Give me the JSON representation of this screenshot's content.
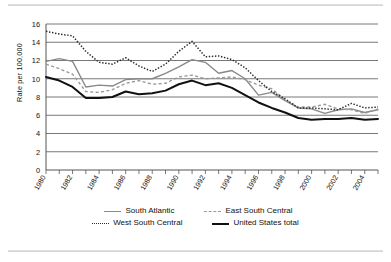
{
  "chart_data": {
    "type": "line",
    "title": "",
    "xlabel": "",
    "ylabel": "Rate per 100,000",
    "ylim": [
      0,
      16
    ],
    "ytick_step": 2,
    "yticks": [
      0,
      2,
      4,
      6,
      8,
      10,
      12,
      14,
      16
    ],
    "xlim": [
      1980,
      2005
    ],
    "xticks": [
      1980,
      1981,
      1982,
      1983,
      1984,
      1985,
      1986,
      1987,
      1988,
      1989,
      1990,
      1991,
      1992,
      1993,
      1994,
      1995,
      1996,
      1997,
      1998,
      1999,
      2000,
      2001,
      2002,
      2003,
      2004,
      2005
    ],
    "xtick_labels": [
      "1980",
      "1982",
      "1984",
      "1986",
      "1988",
      "1990",
      "1992",
      "1994",
      "1996",
      "1998",
      "2000",
      "2002",
      "2004"
    ],
    "xtick_label_values": [
      1980,
      1982,
      1984,
      1986,
      1988,
      1990,
      1992,
      1994,
      1996,
      1998,
      2000,
      2002,
      2004
    ],
    "grid": "horizontal",
    "legend_position": "bottom",
    "x": [
      1980,
      1981,
      1982,
      1983,
      1984,
      1985,
      1986,
      1987,
      1988,
      1989,
      1990,
      1991,
      1992,
      1993,
      1994,
      1995,
      1996,
      1997,
      1998,
      1999,
      2000,
      2001,
      2002,
      2003,
      2004,
      2005
    ],
    "series": [
      {
        "name": "South Atlantic",
        "style": "solid",
        "color": "#8a8a8a",
        "values": [
          11.9,
          12.2,
          11.9,
          9.1,
          9.3,
          9.2,
          9.9,
          10.0,
          10.0,
          10.6,
          11.3,
          12.1,
          11.8,
          10.6,
          10.9,
          10.0,
          8.2,
          8.5,
          7.6,
          6.8,
          6.7,
          6.2,
          6.6,
          6.7,
          6.3,
          6.6
        ]
      },
      {
        "name": "East South Central",
        "style": "dashed",
        "color": "#9a9a9a",
        "values": [
          11.6,
          11.1,
          10.5,
          8.6,
          8.5,
          8.8,
          9.5,
          9.8,
          9.4,
          9.5,
          10.2,
          10.4,
          10.0,
          10.1,
          10.2,
          9.9,
          9.3,
          8.9,
          7.7,
          6.9,
          6.9,
          7.2,
          6.7,
          6.6,
          6.2,
          6.7
        ]
      },
      {
        "name": "West South Central",
        "style": "dotted",
        "color": "#2b2b2b",
        "values": [
          15.2,
          14.9,
          14.7,
          13.0,
          11.8,
          11.6,
          12.3,
          11.4,
          10.8,
          11.6,
          13.0,
          14.1,
          12.4,
          12.5,
          12.1,
          11.2,
          9.8,
          8.6,
          7.8,
          6.8,
          6.8,
          6.7,
          6.6,
          7.3,
          6.8,
          6.9
        ]
      },
      {
        "name": "United States total",
        "style": "solid",
        "color": "#111111",
        "values": [
          10.2,
          9.8,
          9.1,
          7.9,
          7.9,
          8.0,
          8.6,
          8.3,
          8.4,
          8.7,
          9.4,
          9.8,
          9.3,
          9.5,
          9.0,
          8.2,
          7.4,
          6.8,
          6.3,
          5.7,
          5.5,
          5.6,
          5.6,
          5.7,
          5.5,
          5.6
        ]
      }
    ]
  },
  "legend": {
    "rows": [
      [
        {
          "label": "South Atlantic",
          "style": "sw-solid-gray"
        },
        {
          "label": "East South Central",
          "style": "sw-dash-gray"
        }
      ],
      [
        {
          "label": "West South Central",
          "style": "sw-dot-black"
        },
        {
          "label": "United States total",
          "style": "sw-solid-black"
        }
      ]
    ]
  }
}
